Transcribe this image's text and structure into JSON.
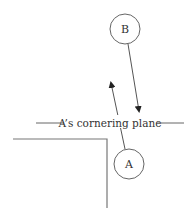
{
  "diagram": {
    "nodes": [
      {
        "id": "B",
        "label": "B",
        "cx": 125,
        "cy": 29,
        "r": 15
      },
      {
        "id": "A",
        "label": "A",
        "cx": 129,
        "cy": 164,
        "r": 15
      }
    ],
    "plane_label": "A’s cornering plane",
    "colors": {
      "stroke": "#555555",
      "text": "#333333",
      "background": "#ffffff"
    }
  }
}
